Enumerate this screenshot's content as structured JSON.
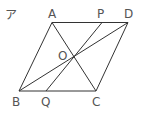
{
  "figure": {
    "tag": "ア",
    "shape": "parallelogram ABCD with diagonals AC, BD meeting at O; line through O meets AD at P and BC at Q",
    "points": {
      "A": {
        "label": "A",
        "x": 52,
        "y": 22.5
      },
      "D": {
        "label": "D",
        "x": 128,
        "y": 22.5
      },
      "B": {
        "label": "B",
        "x": 19,
        "y": 91
      },
      "C": {
        "label": "C",
        "x": 96,
        "y": 91
      },
      "O": {
        "label": "O",
        "x": 74,
        "y": 57
      },
      "P": {
        "label": "P",
        "x": 102,
        "y": 22.5
      },
      "Q": {
        "label": "Q",
        "x": 46,
        "y": 91
      }
    },
    "segments": [
      "AD",
      "DC",
      "CB",
      "BA",
      "AC",
      "BD",
      "PQ"
    ],
    "line_color": "#333333",
    "label_color": "#555555"
  }
}
